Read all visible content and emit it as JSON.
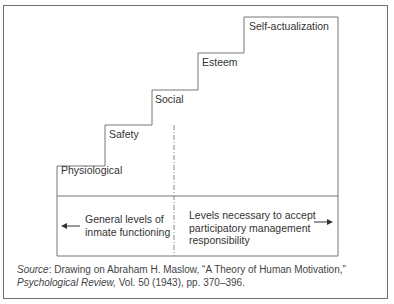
{
  "diagram": {
    "type": "staircase",
    "steps": [
      {
        "label": "Physiological"
      },
      {
        "label": "Safety"
      },
      {
        "label": "Social"
      },
      {
        "label": "Esteem"
      },
      {
        "label": "Self-actualization"
      }
    ],
    "bottom": {
      "left_text_line1": "General levels of",
      "left_text_line2": "inmate functioning",
      "right_text_line1": "Levels necessary to accept",
      "right_text_line2": "participatory management",
      "right_text_line3": "responsibility",
      "left_arrow": "arrow-left",
      "right_arrow": "arrow-right"
    },
    "divider": "dashed-dotted"
  },
  "source": {
    "prefix": "Source",
    "text1": ": Drawing on Abraham H. Maslow, “A Theory of Human Motivation,”",
    "journal": "Psychological Review,",
    "text2": " Vol. 50 (1943), pp. 370–396."
  }
}
